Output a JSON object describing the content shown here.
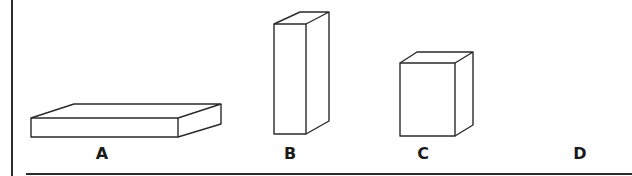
{
  "figure": {
    "stroke_color": "#2a2a2a",
    "background": "#ffffff",
    "items": [
      {
        "label": "A",
        "shape": "flat-box",
        "label_x": 102,
        "label_y": 146
      },
      {
        "label": "B",
        "shape": "tall-box",
        "label_x": 290,
        "label_y": 146
      },
      {
        "label": "C",
        "shape": "cube-like-box",
        "label_x": 423,
        "label_y": 146
      },
      {
        "label": "D",
        "shape": "none",
        "label_x": 580,
        "label_y": 146
      }
    ]
  }
}
